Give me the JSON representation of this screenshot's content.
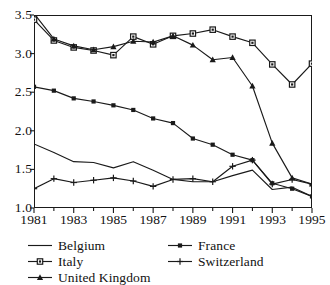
{
  "chart_data": {
    "type": "line",
    "title": "",
    "subtitle": "",
    "xlabel": "",
    "ylabel": "",
    "xlim": [
      1981,
      1995
    ],
    "ylim": [
      1.0,
      3.5
    ],
    "grid": false,
    "legend_position": "below",
    "x": [
      1981,
      1982,
      1983,
      1984,
      1985,
      1986,
      1987,
      1988,
      1989,
      1990,
      1991,
      1992,
      1993,
      1994,
      1995
    ],
    "x_ticks": [
      "1981",
      "1983",
      "1985",
      "1987",
      "1989",
      "1991",
      "1993",
      "1995"
    ],
    "y_ticks": [
      "1.0",
      "1.5",
      "2.0",
      "2.5",
      "3.0",
      "3.5"
    ],
    "series": [
      {
        "name": "Belgium",
        "marker": "none",
        "color": "#1a1a1a",
        "values": [
          1.83,
          1.72,
          1.6,
          1.59,
          1.52,
          1.6,
          1.49,
          1.37,
          1.34,
          1.34,
          1.42,
          1.49,
          1.24,
          1.27,
          1.15
        ]
      },
      {
        "name": "Italy",
        "marker": "square-open",
        "color": "#1a1a1a",
        "values": [
          3.44,
          3.17,
          3.08,
          3.04,
          2.98,
          3.22,
          3.12,
          3.23,
          3.26,
          3.31,
          3.22,
          3.14,
          2.86,
          2.6,
          2.87
        ]
      },
      {
        "name": "United Kingdom",
        "marker": "triangle",
        "color": "#1a1a1a",
        "values": [
          3.52,
          3.19,
          3.1,
          3.05,
          3.09,
          3.16,
          3.15,
          3.23,
          3.11,
          2.92,
          2.95,
          2.58,
          1.84,
          1.39,
          1.31
        ]
      },
      {
        "name": "France",
        "marker": "square-filled",
        "color": "#1a1a1a",
        "values": [
          2.57,
          2.52,
          2.42,
          2.38,
          2.33,
          2.27,
          2.16,
          2.1,
          1.9,
          1.82,
          1.69,
          1.62,
          1.32,
          1.25,
          1.15
        ]
      },
      {
        "name": "Switzerland",
        "marker": "plus",
        "color": "#1a1a1a",
        "values": [
          1.25,
          1.38,
          1.33,
          1.36,
          1.39,
          1.35,
          1.28,
          1.37,
          1.38,
          1.34,
          1.54,
          1.62,
          1.31,
          1.37,
          1.31
        ]
      }
    ]
  },
  "legend": {
    "left": [
      "Belgium",
      "Italy",
      "United Kingdom"
    ],
    "right": [
      "France",
      "Switzerland"
    ]
  }
}
